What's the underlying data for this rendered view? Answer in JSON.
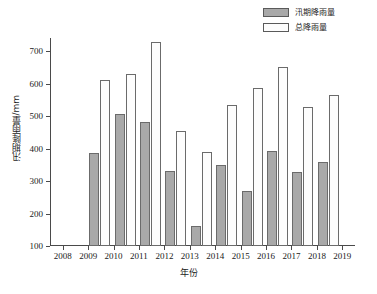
{
  "chart_data": {
    "type": "bar",
    "title": "",
    "xlabel": "年份",
    "ylabel": "汛期降雨量/mm",
    "categories": [
      "2008",
      "2009",
      "2010",
      "2011",
      "2012",
      "2013",
      "2014",
      "2015",
      "2016",
      "2017",
      "2018",
      "2019"
    ],
    "xtick_labels": [
      "2008",
      "2009",
      "2010",
      "2011",
      "2012",
      "2013",
      "2014",
      "2015",
      "2016",
      "2017",
      "2018",
      "2019"
    ],
    "ytick_labels": [
      "100",
      "200",
      "300",
      "400",
      "500",
      "600",
      "700"
    ],
    "ylim": [
      100,
      740
    ],
    "xlim_categories": [
      "2008",
      "2019"
    ],
    "grid": false,
    "legend_position": "top-right",
    "series": [
      {
        "name": "汛期降雨量",
        "color": "#a9a9a9",
        "edge_color": "#6b6b6b",
        "values": [
          null,
          385,
          505,
          482,
          330,
          163,
          350,
          268,
          392,
          327,
          360,
          null
        ]
      },
      {
        "name": "总降雨量",
        "color": "#fdfdfd",
        "edge_color": "#6b6b6b",
        "values": [
          null,
          612,
          630,
          727,
          455,
          390,
          533,
          585,
          652,
          528,
          565,
          null
        ]
      }
    ]
  },
  "legend": {
    "entries": [
      {
        "label": "汛期降雨量",
        "swatch": "#a9a9a9"
      },
      {
        "label": "总降雨量",
        "swatch": "#fdfdfd"
      }
    ]
  },
  "axes": {
    "y_title": "汛期降雨量/mm",
    "x_title": "年份"
  }
}
